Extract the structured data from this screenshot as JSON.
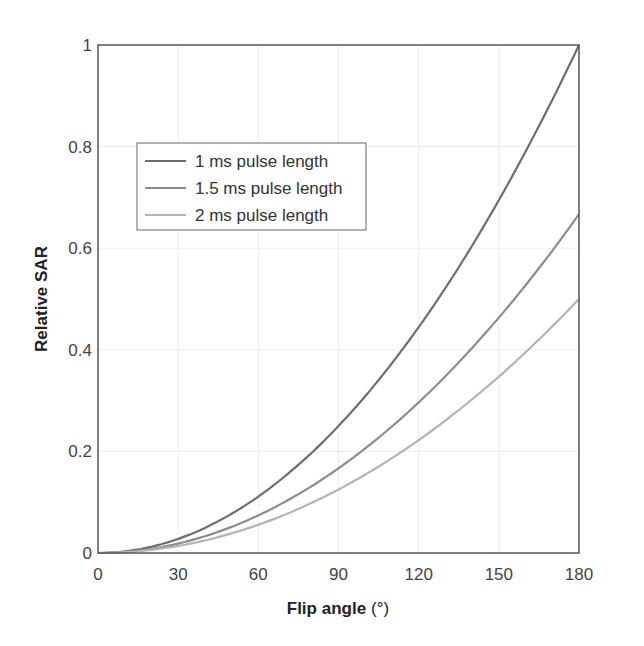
{
  "chart_data": {
    "type": "line",
    "title": "",
    "xlabel": "Flip angle",
    "xlabel_unit": "(°)",
    "ylabel": "Relative SAR",
    "xlim": [
      0,
      180
    ],
    "ylim": [
      0,
      1
    ],
    "xticks": [
      0,
      30,
      60,
      90,
      120,
      150,
      180
    ],
    "yticks": [
      0,
      0.2,
      0.4,
      0.6,
      0.8,
      1
    ],
    "ytick_labels": [
      "0",
      "0.2",
      "0.4",
      "0.6",
      "0.8",
      "1"
    ],
    "grid": true,
    "legend_position": "upper left (inside)",
    "x": [
      0,
      15,
      30,
      45,
      60,
      75,
      90,
      105,
      120,
      135,
      150,
      165,
      180
    ],
    "series": [
      {
        "name": "1 ms pulse length",
        "color": "#6e6e6e",
        "values": [
          0,
          0.007,
          0.028,
          0.063,
          0.111,
          0.174,
          0.25,
          0.34,
          0.444,
          0.563,
          0.694,
          0.84,
          1.0
        ]
      },
      {
        "name": "1.5 ms pulse length",
        "color": "#8c8c8c",
        "values": [
          0,
          0.005,
          0.019,
          0.042,
          0.074,
          0.116,
          0.167,
          0.227,
          0.296,
          0.375,
          0.463,
          0.56,
          0.667
        ]
      },
      {
        "name": "2 ms pulse length",
        "color": "#b4b4b4",
        "values": [
          0,
          0.003,
          0.014,
          0.031,
          0.056,
          0.087,
          0.125,
          0.17,
          0.222,
          0.281,
          0.347,
          0.42,
          0.5
        ]
      }
    ]
  }
}
